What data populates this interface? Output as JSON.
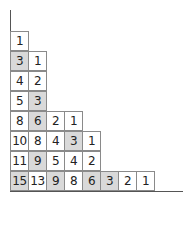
{
  "diagram": {
    "type": "young-diagram-hook-lengths",
    "colors": {
      "shaded": "#d9d9d9",
      "cell": "#ffffff",
      "border": "#8a8a8a",
      "axis": "#555555"
    },
    "rows": [
      [
        {
          "v": "1",
          "s": false
        }
      ],
      [
        {
          "v": "3",
          "s": true
        },
        {
          "v": "1",
          "s": false
        }
      ],
      [
        {
          "v": "4",
          "s": false
        },
        {
          "v": "2",
          "s": false
        }
      ],
      [
        {
          "v": "5",
          "s": false
        },
        {
          "v": "3",
          "s": true
        }
      ],
      [
        {
          "v": "8",
          "s": false
        },
        {
          "v": "6",
          "s": true
        },
        {
          "v": "2",
          "s": false
        },
        {
          "v": "1",
          "s": false
        }
      ],
      [
        {
          "v": "10",
          "s": false
        },
        {
          "v": "8",
          "s": false
        },
        {
          "v": "4",
          "s": false
        },
        {
          "v": "3",
          "s": true
        },
        {
          "v": "1",
          "s": false
        }
      ],
      [
        {
          "v": "11",
          "s": false
        },
        {
          "v": "9",
          "s": true
        },
        {
          "v": "5",
          "s": false
        },
        {
          "v": "4",
          "s": false
        },
        {
          "v": "2",
          "s": false
        }
      ],
      [
        {
          "v": "15",
          "s": true
        },
        {
          "v": "13",
          "s": false
        },
        {
          "v": "9",
          "s": true
        },
        {
          "v": "8",
          "s": false
        },
        {
          "v": "6",
          "s": true
        },
        {
          "v": "3",
          "s": true
        },
        {
          "v": "2",
          "s": false
        },
        {
          "v": "1",
          "s": false
        }
      ]
    ]
  }
}
